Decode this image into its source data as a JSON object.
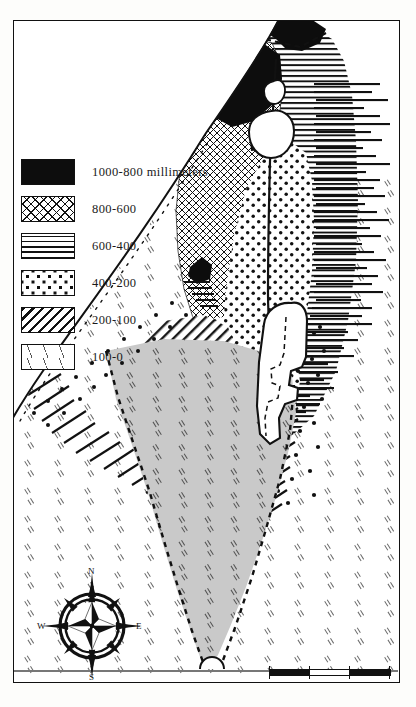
{
  "map": {
    "title": "Rainfall map of Palestine",
    "frame_color": "#111111",
    "land_tone": "#c9c9c9",
    "paper": "#ffffff"
  },
  "legend": {
    "unit_note": "millimeters",
    "items": [
      {
        "label": "1000-800 millimeters",
        "range": "1000-800",
        "pattern": "solid-black",
        "swatch_class": "sw-black"
      },
      {
        "label": "800-600",
        "range": "800-600",
        "pattern": "cross-hatch",
        "swatch_class": "sw-cross"
      },
      {
        "label": "600-400",
        "range": "600-400",
        "pattern": "horizontal-lines",
        "swatch_class": "sw-horiz"
      },
      {
        "label": "400-200",
        "range": "400-200",
        "pattern": "dots",
        "swatch_class": "sw-dots"
      },
      {
        "label": "200-100",
        "range": "200-100",
        "pattern": "diagonal-hatch",
        "swatch_class": "sw-diag"
      },
      {
        "label": "100-0",
        "range": "100-0",
        "pattern": "sparse-dashes",
        "swatch_class": "sw-sparse"
      }
    ]
  },
  "compass": {
    "north": "N",
    "east": "E",
    "south": "S",
    "west": "W"
  },
  "scale": {
    "ticks": [
      "0",
      "10",
      "20",
      "30"
    ],
    "unit": "MILES",
    "max_value": 30
  },
  "features": {
    "dead_sea": "Dead Sea",
    "sea_of_galilee": "Sea of Galilee",
    "lake_hula": "Lake Hula",
    "jordan_river": "Jordan River",
    "gulf": "Gulf of Aqaba",
    "mediterranean": "Mediterranean Sea"
  }
}
